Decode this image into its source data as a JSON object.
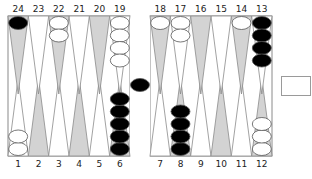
{
  "game": "backgammon",
  "colors": {
    "board_bg": "#ffffff",
    "point_dark": "#d3d3d3",
    "point_light": "#ffffff",
    "point_stroke": "#8a8a8a",
    "frame": "#8a8a8a",
    "checker_black": "#000000",
    "checker_white": "#ffffff",
    "checker_stroke": "#555555"
  },
  "top_labels": [
    "24",
    "23",
    "22",
    "21",
    "20",
    "19",
    "18",
    "17",
    "16",
    "15",
    "14",
    "13"
  ],
  "bottom_labels": [
    "1",
    "2",
    "3",
    "4",
    "5",
    "6",
    "7",
    "8",
    "9",
    "10",
    "11",
    "12"
  ],
  "points": [
    {
      "point": 1,
      "color": "white",
      "count": 2
    },
    {
      "point": 2,
      "color": null,
      "count": 0
    },
    {
      "point": 3,
      "color": null,
      "count": 0
    },
    {
      "point": 4,
      "color": null,
      "count": 0
    },
    {
      "point": 5,
      "color": null,
      "count": 0
    },
    {
      "point": 6,
      "color": "black",
      "count": 5
    },
    {
      "point": 7,
      "color": null,
      "count": 0
    },
    {
      "point": 8,
      "color": "black",
      "count": 4
    },
    {
      "point": 9,
      "color": null,
      "count": 0
    },
    {
      "point": 10,
      "color": null,
      "count": 0
    },
    {
      "point": 11,
      "color": null,
      "count": 0
    },
    {
      "point": 12,
      "color": "white",
      "count": 3
    },
    {
      "point": 13,
      "color": "black",
      "count": 4
    },
    {
      "point": 14,
      "color": "white",
      "count": 1
    },
    {
      "point": 15,
      "color": null,
      "count": 0
    },
    {
      "point": 16,
      "color": null,
      "count": 0
    },
    {
      "point": 17,
      "color": "white",
      "count": 2
    },
    {
      "point": 18,
      "color": "white",
      "count": 1
    },
    {
      "point": 19,
      "color": "white",
      "count": 4
    },
    {
      "point": 20,
      "color": null,
      "count": 0
    },
    {
      "point": 21,
      "color": null,
      "count": 0
    },
    {
      "point": 22,
      "color": "white",
      "count": 2
    },
    {
      "point": 23,
      "color": null,
      "count": 0
    },
    {
      "point": 24,
      "color": "black",
      "count": 1
    }
  ],
  "bar": {
    "black": 1,
    "white": 0
  },
  "cube": {
    "value": ""
  }
}
